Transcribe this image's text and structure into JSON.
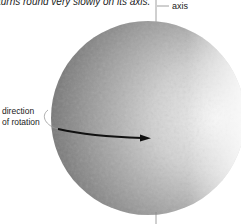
{
  "caption": "turns round very slowly on its axis.",
  "labels": {
    "axis": "axis",
    "direction_line1": "direction",
    "direction_line2": "of rotation"
  },
  "planet": {
    "center": [
      148,
      118
    ],
    "radius": 97,
    "colors": {
      "dark": "#6e6e6e",
      "mid": "#9c9c9c",
      "light": "#e4e4e4"
    }
  }
}
